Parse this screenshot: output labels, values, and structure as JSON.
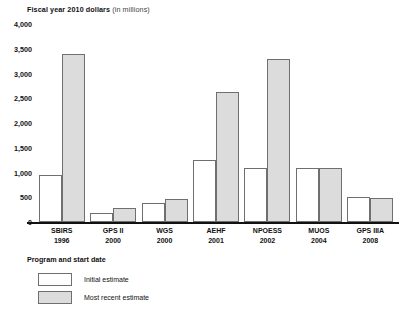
{
  "chart_data": {
    "type": "bar",
    "title": "Fiscal year 2010 dollars (in millions)",
    "title_bold_part": "Fiscal year 2010 dollars",
    "title_unit_part": " (in millions)",
    "xlabel": "Program and start date",
    "ylabel": "",
    "ylim": [
      0,
      4000
    ],
    "grid": false,
    "legend_position": "bottom-left",
    "categories": [
      "SBIRS",
      "GPS II",
      "WGS",
      "AEHF",
      "NPOESS",
      "MUOS",
      "GPS IIIA"
    ],
    "category_sublabels": [
      "1996",
      "2000",
      "2000",
      "2001",
      "2002",
      "2004",
      "2008"
    ],
    "ytick_labels": [
      "0",
      "500",
      "1,000",
      "1,500",
      "2,000",
      "2,500",
      "3,000",
      "3,500",
      "4,000"
    ],
    "ytick_values": [
      0,
      500,
      1000,
      1500,
      2000,
      2500,
      3000,
      3500,
      4000
    ],
    "series": [
      {
        "name": "Initial estimate",
        "color": "#ffffff",
        "values": [
          950,
          175,
          380,
          1250,
          1100,
          1100,
          500
        ]
      },
      {
        "name": "Most recent estimate",
        "color": "#dcdcdc",
        "values": [
          3400,
          275,
          460,
          2620,
          3300,
          1090,
          480
        ]
      }
    ]
  },
  "legend": {
    "items": [
      {
        "label": "Initial estimate",
        "swatch": "white-swatch"
      },
      {
        "label": "Most recent estimate",
        "swatch": "gray-swatch"
      }
    ]
  }
}
